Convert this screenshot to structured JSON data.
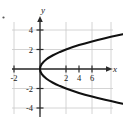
{
  "figure": {
    "type": "math-graph",
    "background_color": "#ffffff",
    "grid_color": "#c9c9c9",
    "axis_color": "#2b2b2b",
    "curve_color": "#111111",
    "stray_mark": "•"
  },
  "chart_data": {
    "type": "line",
    "title": "",
    "subtitle": "",
    "xlabel": "x",
    "ylabel": "y",
    "grid": true,
    "legend": "none",
    "xlim": [
      -3,
      7.5
    ],
    "ylim": [
      -5,
      5
    ],
    "x_ticks": [
      -2,
      2,
      4,
      6
    ],
    "y_ticks": [
      4,
      2,
      -2,
      -4
    ],
    "x_tick_labels": [
      "-2",
      "2",
      "4",
      "6"
    ],
    "y_tick_labels": [
      "4",
      "2",
      "-2",
      "-4"
    ],
    "grid_x_lines": [
      -2,
      0,
      2,
      4,
      6
    ],
    "grid_y_lines": [
      4,
      2,
      0,
      -2,
      -4
    ],
    "series": [
      {
        "name": "sideways parabola",
        "equation": "x = y^2 / 2",
        "comment": "vertex at origin, opening right",
        "points": [
          [
            7.0,
            -3.74
          ],
          [
            6.0,
            -3.46
          ],
          [
            5.0,
            -3.16
          ],
          [
            4.0,
            -2.83
          ],
          [
            3.0,
            -2.45
          ],
          [
            2.0,
            -2.0
          ],
          [
            1.5,
            -1.73
          ],
          [
            1.0,
            -1.41
          ],
          [
            0.5,
            -1.0
          ],
          [
            0.125,
            -0.5
          ],
          [
            0.0,
            0.0
          ],
          [
            0.125,
            0.5
          ],
          [
            0.5,
            1.0
          ],
          [
            1.0,
            1.41
          ],
          [
            1.5,
            1.73
          ],
          [
            2.0,
            2.0
          ],
          [
            3.0,
            2.45
          ],
          [
            4.0,
            2.83
          ],
          [
            5.0,
            3.16
          ],
          [
            6.0,
            3.46
          ],
          [
            7.0,
            3.74
          ]
        ]
      }
    ]
  }
}
